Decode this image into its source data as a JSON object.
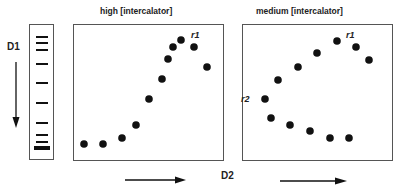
{
  "figure": {
    "dimension_labels": {
      "d1": "D1",
      "d2": "D2"
    },
    "gel_lane": {
      "band_y": [
        36,
        42,
        49,
        63,
        82,
        102,
        122,
        134,
        141
      ],
      "thick_band_y": 147
    },
    "panels": [
      {
        "title": "high [intercalator]",
        "box": {
          "x": 73,
          "y": 24,
          "w": 151,
          "h": 137
        },
        "spots": [
          [
            84,
            144
          ],
          [
            103,
            144
          ],
          [
            122,
            138
          ],
          [
            136,
            125
          ],
          [
            149,
            99
          ],
          [
            162,
            79
          ],
          [
            168,
            59
          ],
          [
            173,
            47
          ],
          [
            181,
            40
          ],
          [
            194,
            47
          ],
          [
            207,
            67
          ]
        ],
        "labels": [
          {
            "text": "r1",
            "x": 191,
            "y": 30
          }
        ]
      },
      {
        "title": "medium [intercalator]",
        "box": {
          "x": 242,
          "y": 24,
          "w": 151,
          "h": 137
        },
        "spots": [
          [
            265,
            99
          ],
          [
            278,
            80
          ],
          [
            298,
            67
          ],
          [
            317,
            53
          ],
          [
            337,
            41
          ],
          [
            356,
            47
          ],
          [
            369,
            60
          ],
          [
            271,
            118
          ],
          [
            290,
            125
          ],
          [
            310,
            131
          ],
          [
            330,
            138
          ],
          [
            349,
            138
          ]
        ],
        "labels": [
          {
            "text": "r1",
            "x": 346,
            "y": 30
          },
          {
            "text": "r2",
            "x": 241,
            "y": 94
          }
        ]
      }
    ],
    "colors": {
      "ink": "#111111",
      "frame": "#555555",
      "background": "#ffffff"
    }
  }
}
